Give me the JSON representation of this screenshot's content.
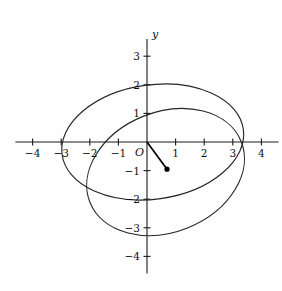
{
  "figure": {
    "title": "",
    "axis_labels": {
      "x": "x",
      "y": "y",
      "origin": "O"
    }
  },
  "chart_data": {
    "type": "line",
    "title": "",
    "xlabel": "x",
    "ylabel": "y",
    "grid": false,
    "legend": "none",
    "xlim": [
      -4.6,
      4.6
    ],
    "ylim": [
      -4.6,
      3.6
    ],
    "xticks": [
      -4,
      -3,
      -2,
      -1,
      1,
      2,
      3,
      4
    ],
    "yticks": [
      3,
      2,
      1,
      -1,
      -2,
      -3,
      -4
    ],
    "xtick_labels": [
      "-4",
      "-3",
      "-2",
      "-1",
      "1",
      "2",
      "3",
      "4"
    ],
    "ytick_labels": [
      "3",
      "2",
      "1",
      "-1",
      "-2",
      "-3",
      "-4"
    ],
    "origin_label": "O",
    "series": [
      {
        "name": "ellipse-1",
        "kind": "ellipse",
        "center": [
          0.2,
          0.0
        ],
        "semi_major": 3.2,
        "semi_minor": 2.0,
        "rotation_deg": -8,
        "x_intercepts": [
          -3.05,
          3.4
        ],
        "y_intercepts": [
          1.95,
          -2.0
        ]
      },
      {
        "name": "ellipse-2",
        "kind": "ellipse",
        "center": [
          0.65,
          -1.05
        ],
        "semi_major": 2.85,
        "semi_minor": 2.1,
        "rotation_deg": -22,
        "x_intercepts": [
          -2.1,
          2.7
        ],
        "y_intercepts": [
          0.95,
          -3.05
        ]
      }
    ],
    "points": [
      {
        "name": "origin",
        "x": 0,
        "y": 0,
        "marker": "none",
        "label": "O"
      },
      {
        "name": "center-point",
        "x": 0.7,
        "y": -0.95,
        "marker": "filled-circle",
        "label": ""
      }
    ],
    "segments": [
      {
        "name": "radius-segment",
        "from": [
          0,
          0
        ],
        "to": [
          0.7,
          -0.95
        ]
      }
    ]
  }
}
